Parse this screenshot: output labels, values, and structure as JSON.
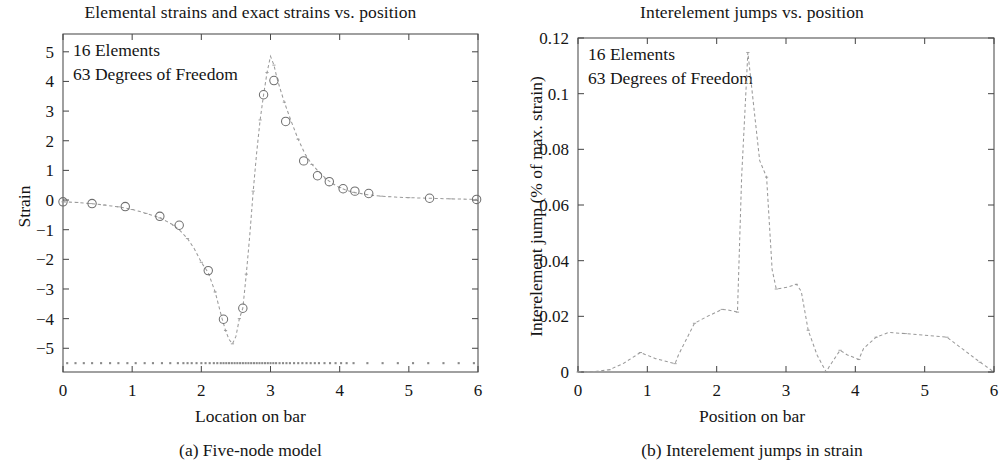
{
  "figure": {
    "panels": [
      {
        "id": "panel-a",
        "title": "Elemental strains and exact strains vs. position",
        "caption": "(a) Five-node model",
        "annotations": [
          "16 Elements",
          "63 Degrees of Freedom"
        ],
        "xlabel": "Location on bar",
        "ylabel": "Strain"
      },
      {
        "id": "panel-b",
        "title": "Interelement jumps vs. position",
        "caption": "(b) Interelement jumps in strain",
        "annotations": [
          "16 Elements",
          "63 Degrees of Freedom"
        ],
        "xlabel": "Position on bar",
        "ylabel": "Interelement jump (% of max. strain)"
      }
    ],
    "colors": {
      "axis": "#4a4a4a",
      "curve": "#8d8d8d",
      "marker": "#6f6f6f",
      "text": "#151515",
      "background": "#ffffff"
    }
  },
  "chart_data": [
    {
      "type": "line",
      "id": "panel-a",
      "title": "Elemental strains and exact strains vs. position",
      "subtitle": "(a) Five-node model",
      "xlabel": "Location on bar",
      "ylabel": "Strain",
      "xlim": [
        0,
        6
      ],
      "ylim": [
        -5.8,
        5.6
      ],
      "xticks": [
        0,
        1,
        2,
        3,
        4,
        5,
        6
      ],
      "yticks": [
        -5,
        -4,
        -3,
        -2,
        -1,
        0,
        1,
        2,
        3,
        4,
        5
      ],
      "grid": false,
      "legend": null,
      "annotations": [
        "16 Elements",
        "63 Degrees of Freedom"
      ],
      "series": [
        {
          "name": "exact strain",
          "style": "dashed-line",
          "x": [
            0.0,
            0.1,
            0.2,
            0.3,
            0.4,
            0.5,
            0.6,
            0.7,
            0.8,
            0.9,
            1.0,
            1.1,
            1.2,
            1.3,
            1.4,
            1.5,
            1.6,
            1.7,
            1.8,
            1.9,
            2.0,
            2.1,
            2.2,
            2.3,
            2.35,
            2.4,
            2.45,
            2.5,
            2.55,
            2.6,
            2.65,
            2.7,
            2.75,
            2.8,
            2.85,
            2.9,
            2.95,
            3.0,
            3.05,
            3.1,
            3.2,
            3.3,
            3.4,
            3.5,
            3.6,
            3.7,
            3.8,
            3.9,
            4.0,
            4.1,
            4.2,
            4.4,
            4.6,
            4.8,
            5.0,
            5.3,
            5.6,
            6.0
          ],
          "y": [
            -0.06,
            -0.07,
            -0.08,
            -0.1,
            -0.12,
            -0.14,
            -0.17,
            -0.2,
            -0.23,
            -0.27,
            -0.32,
            -0.38,
            -0.45,
            -0.52,
            -0.6,
            -0.72,
            -0.85,
            -1.05,
            -1.3,
            -1.65,
            -2.1,
            -2.45,
            -3.1,
            -4.0,
            -4.4,
            -4.7,
            -4.85,
            -4.6,
            -4.0,
            -3.65,
            -2.5,
            -1.2,
            0.3,
            1.6,
            2.7,
            3.55,
            4.3,
            4.85,
            4.55,
            4.05,
            3.3,
            2.65,
            2.05,
            1.55,
            1.2,
            0.95,
            0.72,
            0.55,
            0.42,
            0.33,
            0.26,
            0.18,
            0.13,
            0.1,
            0.08,
            0.06,
            0.04,
            0.02
          ]
        },
        {
          "name": "elemental strain (nodal markers)",
          "style": "open-circles",
          "x": [
            0.0,
            0.42,
            0.9,
            1.4,
            1.68,
            2.1,
            2.32,
            2.6,
            2.9,
            3.05,
            3.22,
            3.48,
            3.68,
            3.85,
            4.05,
            4.22,
            4.42,
            5.3,
            5.98
          ],
          "y": [
            -0.06,
            -0.12,
            -0.22,
            -0.55,
            -0.85,
            -2.38,
            -4.02,
            -3.65,
            3.55,
            4.03,
            2.65,
            1.32,
            0.82,
            0.62,
            0.38,
            0.3,
            0.22,
            0.06,
            0.02
          ]
        },
        {
          "name": "element sample points",
          "style": "dot-row",
          "y_constant": -5.5,
          "x": [
            0.06,
            0.18,
            0.3,
            0.42,
            0.55,
            0.68,
            0.8,
            0.93,
            1.05,
            1.18,
            1.3,
            1.43,
            1.55,
            1.66,
            1.74,
            1.8,
            1.86,
            1.93,
            2.0,
            2.06,
            2.12,
            2.18,
            2.23,
            2.28,
            2.32,
            2.36,
            2.4,
            2.44,
            2.48,
            2.52,
            2.56,
            2.6,
            2.64,
            2.68,
            2.72,
            2.76,
            2.8,
            2.84,
            2.88,
            2.92,
            2.96,
            3.0,
            3.04,
            3.08,
            3.13,
            3.18,
            3.23,
            3.28,
            3.34,
            3.4,
            3.46,
            3.52,
            3.58,
            3.64,
            3.7,
            3.78,
            3.86,
            3.94,
            4.02,
            4.1,
            4.2,
            4.4,
            4.62,
            4.84,
            5.06,
            5.28,
            5.5,
            5.72,
            5.94
          ]
        }
      ]
    },
    {
      "type": "line",
      "id": "panel-b",
      "title": "Interelement jumps vs. position",
      "subtitle": "(b) Interelement jumps in strain",
      "xlabel": "Position on bar",
      "ylabel": "Interelement jump (% of max. strain)",
      "xlim": [
        0,
        6
      ],
      "ylim": [
        0,
        0.12
      ],
      "xticks": [
        0,
        1,
        2,
        3,
        4,
        5,
        6
      ],
      "yticks": [
        0,
        0.02,
        0.04,
        0.06,
        0.08,
        0.1,
        0.12
      ],
      "ytick_labels": [
        "0",
        "0.02",
        "0.04",
        "0.06",
        "0.08",
        "0.1",
        "0.12"
      ],
      "grid": false,
      "legend": null,
      "annotations": [
        "16 Elements",
        "63 Degrees of Freedom"
      ],
      "series": [
        {
          "name": "interelement jump",
          "style": "dashed-line",
          "x": [
            0.0,
            0.25,
            0.45,
            0.65,
            0.9,
            1.12,
            1.4,
            1.45,
            1.68,
            1.85,
            2.08,
            2.18,
            2.3,
            2.36,
            2.45,
            2.62,
            2.72,
            2.8,
            2.86,
            3.02,
            3.15,
            3.22,
            3.32,
            3.45,
            3.58,
            3.62,
            3.78,
            3.88,
            4.05,
            4.12,
            4.3,
            4.48,
            4.72,
            5.0,
            5.32,
            5.55,
            5.8,
            6.0
          ],
          "y": [
            0.0,
            0.0002,
            0.0008,
            0.003,
            0.007,
            0.0048,
            0.003,
            0.0062,
            0.0175,
            0.0198,
            0.0225,
            0.0222,
            0.0215,
            0.07,
            0.1148,
            0.076,
            0.07,
            0.0368,
            0.0298,
            0.0305,
            0.0315,
            0.029,
            0.015,
            0.006,
            0.0,
            0.0018,
            0.0078,
            0.0062,
            0.0045,
            0.0085,
            0.0125,
            0.0142,
            0.0138,
            0.0132,
            0.0125,
            0.0082,
            0.0035,
            0.0
          ]
        }
      ]
    }
  ]
}
